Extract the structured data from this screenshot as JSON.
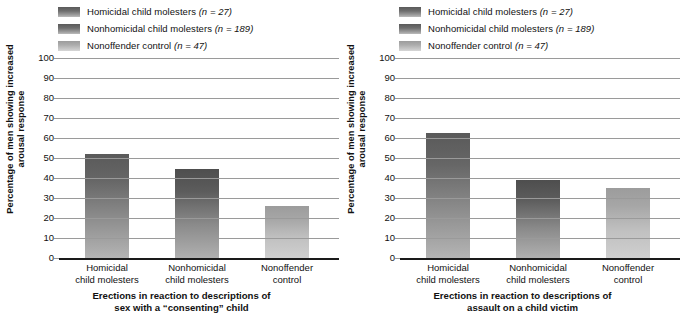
{
  "chart_data": [
    {
      "type": "bar",
      "panel": "left",
      "title": "Erections in reaction to descriptions of sex with a “consenting” child",
      "title_lines": [
        "Erections in reaction to descriptions of",
        "sex with a “consenting” child"
      ],
      "xlabel": "",
      "ylabel": "Percentage of men showing increased arousal response",
      "ylabel_lines": [
        "Percentage of men showing increased",
        "arousal response"
      ],
      "ylim": [
        0,
        100
      ],
      "ytick_values": [
        100,
        90,
        80,
        70,
        60,
        50,
        40,
        30,
        20,
        10,
        0
      ],
      "ytick_labels": [
        "100",
        "90",
        "80",
        "70",
        "60",
        "50",
        "40",
        "30",
        "20",
        "10",
        "0"
      ],
      "grid": true,
      "legend_position": "top",
      "categories": [
        "Homicidal child molesters",
        "Nonhomicidal child molesters",
        "Nonoffender control"
      ],
      "category_label_lines": [
        [
          "Homicidal",
          "child molesters"
        ],
        [
          "Nonhomicidal",
          "child molesters"
        ],
        [
          "Nonoffender",
          "control"
        ]
      ],
      "values": [
        52,
        44.5,
        26
      ]
    },
    {
      "type": "bar",
      "panel": "right",
      "title": "Erections in reaction to descriptions of assault on a child victim",
      "title_lines": [
        "Erections in reaction to descriptions of",
        "assault on a child victim"
      ],
      "xlabel": "",
      "ylabel": "Percentage of men showing increased arousal response",
      "ylabel_lines": [
        "Percentage of men showing increased",
        "arousal response"
      ],
      "ylim": [
        0,
        100
      ],
      "ytick_values": [
        100,
        90,
        80,
        70,
        60,
        50,
        40,
        30,
        20,
        10,
        0
      ],
      "ytick_labels": [
        "100",
        "90",
        "80",
        "70",
        "60",
        "50",
        "40",
        "30",
        "20",
        "10",
        "0"
      ],
      "grid": true,
      "legend_position": "top",
      "categories": [
        "Homicidal child molesters",
        "Nonhomicidal child molesters",
        "Nonoffender control"
      ],
      "category_label_lines": [
        [
          "Homicidal",
          "child molesters"
        ],
        [
          "Nonhomicidal",
          "child molesters"
        ],
        [
          "Nonoffender",
          "control"
        ]
      ],
      "values": [
        62.5,
        39,
        35
      ]
    }
  ],
  "legend": {
    "items": [
      {
        "label_main": "Homicidal child molesters",
        "label_n": "(n = 27)",
        "color_top": "#5a5a5a",
        "color_bottom": "#b4b4b4"
      },
      {
        "label_main": "Nonhomicidal child molesters",
        "label_n": "(n = 189)",
        "color_top": "#5a5a5a",
        "color_bottom": "#b4b4b4"
      },
      {
        "label_main": "Nonoffender control",
        "label_n": "(n = 47)",
        "color_top": "#9c9c9c",
        "color_bottom": "#d2d2d2"
      }
    ]
  },
  "colors": {
    "gridline": "#9a9a9a",
    "axis": "#1a1a1a",
    "text": "#111111",
    "background": "#ffffff",
    "series_1_top": "#5a5a5a",
    "series_1_bottom": "#b4b4b4",
    "series_2_top": "#4e4e4e",
    "series_2_bottom": "#b0b0b0",
    "series_3_top": "#9c9c9c",
    "series_3_bottom": "#cfcfcf"
  }
}
